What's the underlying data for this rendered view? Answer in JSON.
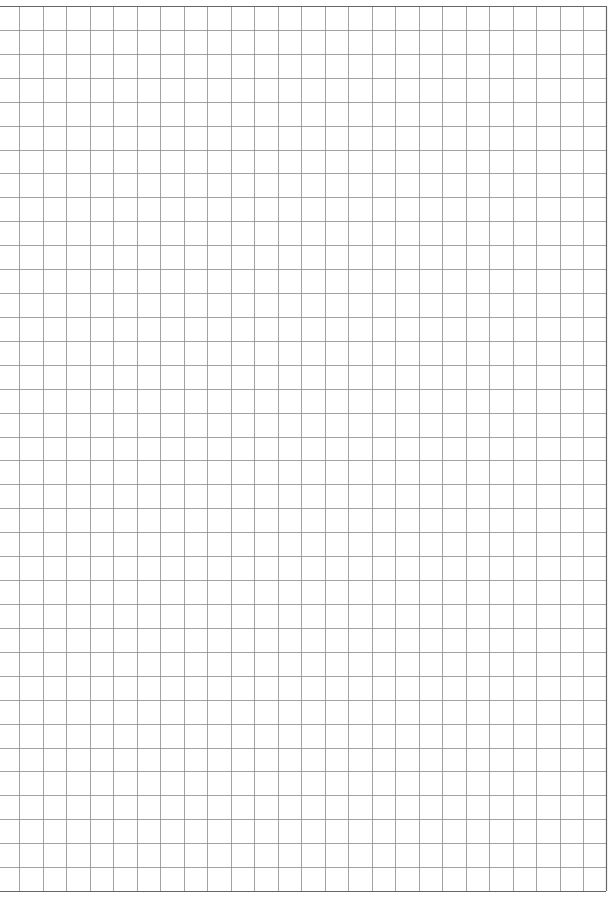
{
  "page": {
    "type": "grid-paper",
    "background": "#ffffff",
    "line_color": "#8a8a8a",
    "border_color": "#666666"
  },
  "grid": {
    "left": 0,
    "top": 6,
    "right": 606,
    "bottom": 891,
    "first_vertical": 19,
    "col_spacing": 23.5,
    "row_spacing": 23.92,
    "columns": 26,
    "rows": 37
  }
}
